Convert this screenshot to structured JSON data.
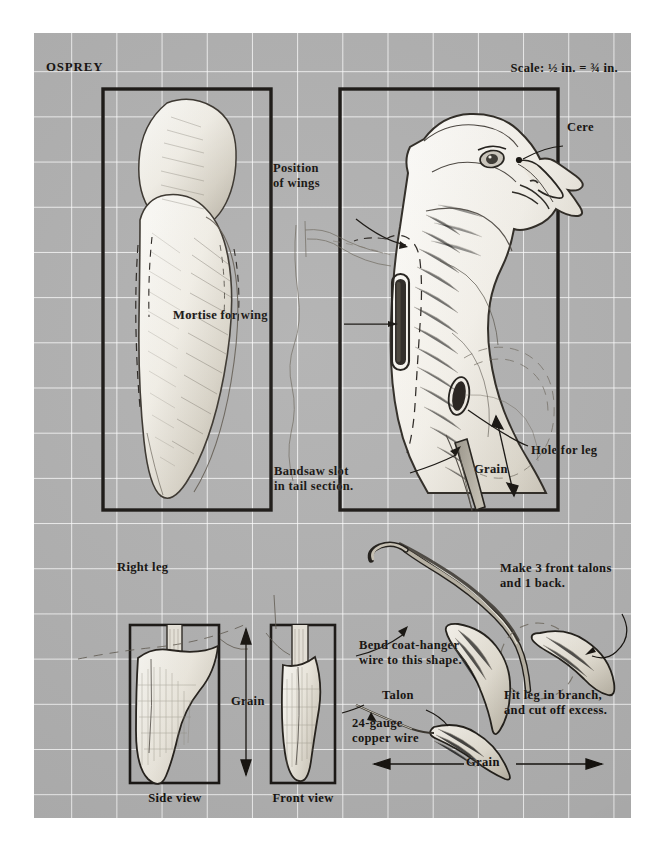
{
  "sheet": {
    "title": "OSPREY",
    "scale_note": "Scale: ½ in. = ¾ in.",
    "background_color": "#b1b1b1",
    "grid_color": "#ffffff",
    "ink_color": "#15120f"
  },
  "top_view_left": {
    "name": "top-plan-profile"
  },
  "side_view_right": {
    "labels": {
      "position_of_wings": "Position\nof wings",
      "mortise_for_wing": "Mortise for wing",
      "cere": "Cere",
      "hole_for_leg": "Hole for leg",
      "grain": "Grain",
      "bandsaw_slot": "Bandsaw slot\nin tail section."
    }
  },
  "leg_detail": {
    "right_leg": "Right leg",
    "grain": "Grain",
    "side_view": "Side view",
    "front_view": "Front view"
  },
  "talon_detail": {
    "bend_wire": "Bend coat-hanger\nwire to this shape.",
    "make_talons": "Make 3 front talons\nand 1 back.",
    "talon": "Talon",
    "copper_wire": "24-gauge\ncopper wire",
    "fit_leg": "Fit leg in branch,\nand cut off excess.",
    "grain": "Grain"
  }
}
